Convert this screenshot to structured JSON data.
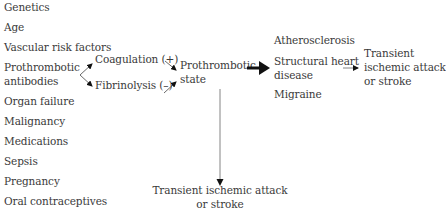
{
  "diagram": {
    "risk_factors": [
      "Genetics",
      "Age",
      "Vascular risk factors",
      "Prothrombotic",
      "antibodies",
      "Organ failure",
      "Malignancy",
      "Medications",
      "Sepsis",
      "Pregnancy",
      "Oral contraceptives"
    ],
    "mechanisms": {
      "coagulation": "Coagulation (+)",
      "fibrinolysis": "Fibrinolysis (–)"
    },
    "state": {
      "line1": "Prothrombotic",
      "line2": "state"
    },
    "conditions": {
      "atherosclerosis": "Atherosclerosis",
      "structural_line1": "Structural heart",
      "structural_line2": "disease",
      "migraine": "Migraine"
    },
    "outcome_right": {
      "line1": "Transient",
      "line2": "ischemic attack",
      "line3": "or stroke"
    },
    "outcome_bottom": {
      "line1": "Transient ischemic attack",
      "line2": "or stroke"
    }
  }
}
